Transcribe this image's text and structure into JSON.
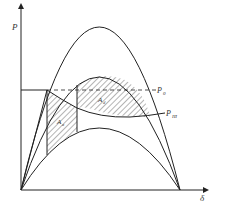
{
  "diagram": {
    "type": "power-angle-curve",
    "axes": {
      "y_label": "P",
      "x_label": "δ"
    },
    "labels": {
      "p0": "P",
      "p0_sub": "0",
      "pm": "P",
      "pm_sub": "III",
      "area_upper": "A",
      "area_upper_sub": "d",
      "area_lower": "A",
      "area_lower_sub": "a"
    },
    "curves": [
      "normal operation (upper)",
      "post-fault (middle)",
      "during fault (lower)"
    ],
    "colors": {
      "line": "#222222",
      "hatch": "#444444",
      "background": "#ffffff"
    }
  }
}
